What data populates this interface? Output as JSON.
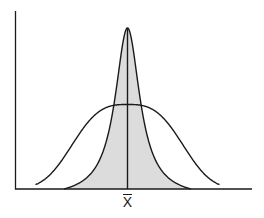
{
  "diagram": {
    "colors": {
      "line": "#1a1a1a",
      "shaded_fill": "#dcdcdc",
      "background": "#ffffff"
    },
    "axes": {
      "origin": [
        15.5,
        189
      ],
      "y_top": 11,
      "x_end": 252
    },
    "mean": {
      "x": 127.5,
      "label": "X",
      "label_overline": true
    },
    "narrow_curve": {
      "name": "narrow-shaded-distribution",
      "peak_y": 28,
      "half_width_scale": 15,
      "extent": 63.5,
      "shaded": true
    },
    "wide_curve": {
      "name": "wide-distribution",
      "peak_y": 104.5,
      "scale": 64,
      "exponent": 3,
      "extent": 92
    }
  }
}
